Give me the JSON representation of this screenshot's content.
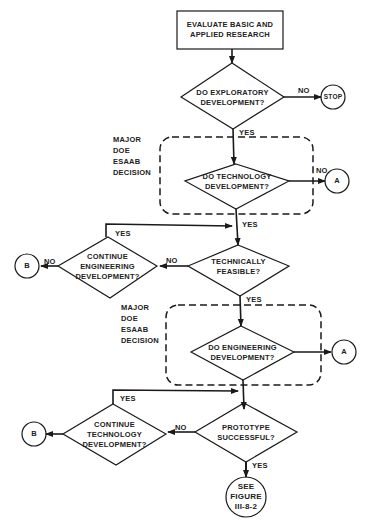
{
  "diagram": {
    "type": "flowchart",
    "colors": {
      "stroke": "#1a1a1a",
      "background": "#ffffff",
      "text": "#222222"
    },
    "nodes": {
      "start": {
        "shape": "rectangle",
        "text": "EVALUATE BASIC AND\nAPPLIED RESEARCH"
      },
      "d_exploratory": {
        "shape": "diamond",
        "text": "DO EXPLORATORY\nDEVELOPMENT?"
      },
      "stop": {
        "shape": "circle",
        "text": "STOP"
      },
      "d_technology": {
        "shape": "diamond",
        "text": "DO TECHNOLOGY\nDEVELOPMENT?"
      },
      "conn_a1": {
        "shape": "circle",
        "text": "A"
      },
      "d_feasible": {
        "shape": "diamond",
        "text": "TECHNICALLY\nFEASIBLE?"
      },
      "d_cont_eng": {
        "shape": "diamond",
        "text": "CONTINUE\nENGINEERING\nDEVELOPMENT?"
      },
      "conn_b1": {
        "shape": "circle",
        "text": "B"
      },
      "d_engineering": {
        "shape": "diamond",
        "text": "DO ENGINEERING\nDEVELOPMENT?"
      },
      "conn_a2": {
        "shape": "circle",
        "text": "A"
      },
      "d_prototype": {
        "shape": "diamond",
        "text": "PROTOTYPE\nSUCCESSFUL?"
      },
      "d_cont_tech": {
        "shape": "diamond",
        "text": "CONTINUE\nTECHNOLOGY\nDEVELOPMENT?"
      },
      "conn_b2": {
        "shape": "circle",
        "text": "B"
      },
      "end": {
        "shape": "circle",
        "text": "SEE\nFIGURE\nIII-8-2"
      }
    },
    "groups": [
      {
        "text": "MAJOR\nDOE\nESAAB\nDECISION",
        "contains": "d_technology"
      },
      {
        "text": "MAJOR\nDOE\nESAAB\nDECISION",
        "contains": "d_engineering"
      }
    ],
    "edge_labels": {
      "exploratory_no": "NO",
      "exploratory_yes": "YES",
      "technology_no": "NO",
      "technology_yes": "YES",
      "feasible_no": "NO",
      "feasible_yes": "YES",
      "cont_eng_no": "NO",
      "cont_eng_yes": "YES",
      "prototype_no": "NO",
      "prototype_yes": "YES",
      "cont_tech_yes": "YES"
    },
    "edges": [
      {
        "from": "start",
        "to": "d_exploratory"
      },
      {
        "from": "d_exploratory",
        "to": "stop",
        "label": "NO"
      },
      {
        "from": "d_exploratory",
        "to": "d_technology",
        "label": "YES"
      },
      {
        "from": "d_technology",
        "to": "conn_a1",
        "label": "NO"
      },
      {
        "from": "d_technology",
        "to": "d_feasible",
        "label": "YES"
      },
      {
        "from": "d_feasible",
        "to": "d_cont_eng",
        "label": "NO"
      },
      {
        "from": "d_cont_eng",
        "to": "conn_b1",
        "label": "NO"
      },
      {
        "from": "d_cont_eng",
        "to": "d_feasible",
        "label": "YES"
      },
      {
        "from": "d_feasible",
        "to": "d_engineering",
        "label": "YES"
      },
      {
        "from": "d_engineering",
        "to": "conn_a2",
        "label": "NO"
      },
      {
        "from": "d_engineering",
        "to": "d_prototype",
        "label": "YES"
      },
      {
        "from": "d_prototype",
        "to": "d_cont_tech",
        "label": "NO"
      },
      {
        "from": "d_cont_tech",
        "to": "conn_b2",
        "label": "NO"
      },
      {
        "from": "d_cont_tech",
        "to": "d_prototype",
        "label": "YES"
      },
      {
        "from": "d_prototype",
        "to": "end",
        "label": "YES"
      }
    ]
  }
}
